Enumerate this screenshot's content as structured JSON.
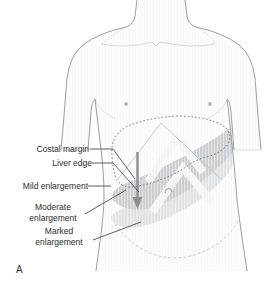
{
  "diagram": {
    "panel_letter": "A",
    "labels": {
      "costal_margin": "Costal margin",
      "liver_edge": "Liver edge",
      "mild": "Mild enlargement",
      "moderate": "Moderate enlargement",
      "marked": "Marked enlargement"
    }
  },
  "colors": {
    "background": "#ffffff",
    "body_fill": "#fcfcfd",
    "body_outline": "#909498",
    "band_mild": "#ccd0d3",
    "band_moderate": "#e1e4e6",
    "dotted_outline": "#6f7375",
    "leader_line": "#4d4d4d",
    "arrow": "#8a9094",
    "faint_line": "#c6c9cb",
    "text": "#2b2b2b"
  }
}
